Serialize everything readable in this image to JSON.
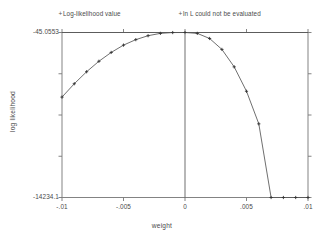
{
  "chart_data": {
    "type": "line",
    "title": "",
    "xlabel": "weight",
    "ylabel": "log likelihood",
    "xlim": [
      -0.01,
      0.01
    ],
    "ylim": [
      -14234.1,
      -45.0553
    ],
    "grid": false,
    "legend_position": "top",
    "xticks": [
      -0.01,
      -0.005,
      0,
      0.005,
      0.01
    ],
    "xticklabels": [
      "-.01",
      "-.005",
      "0",
      ".005",
      ".01"
    ],
    "yticks": [
      -45.0553,
      -14234.1
    ],
    "yticklabels": [
      "-45.0553",
      "-14234.1"
    ],
    "reference_line": {
      "name": "maximum-log-likelihood-line",
      "y": -45.0553,
      "orientation": "horizontal"
    },
    "vertical_line": {
      "name": "mle-weight-line",
      "x": 0,
      "orientation": "vertical"
    },
    "legend": [
      {
        "marker": "+",
        "label": "Log-likelihood value"
      },
      {
        "marker": "+",
        "label": "ln L could not be evaluated"
      }
    ],
    "series": [
      {
        "name": "Log-likelihood value",
        "marker": "+",
        "x": [
          -0.01,
          -0.009,
          -0.008,
          -0.007,
          -0.006,
          -0.005,
          -0.004,
          -0.003,
          -0.002,
          -0.001,
          0.0,
          0.001,
          0.002,
          0.003,
          0.004,
          0.005,
          0.006,
          0.007,
          0.008,
          0.009,
          0.01
        ],
        "y": [
          -5600,
          -4450,
          -3420,
          -2520,
          -1760,
          -1130,
          -660,
          -320,
          -120,
          -50,
          -45.0553,
          -120,
          -560,
          -1500,
          -3000,
          -5100,
          -7900,
          -14234.1,
          -14234.1,
          -14234.1,
          -14234.1
        ]
      }
    ]
  },
  "axis": {
    "x_title": "weight",
    "y_title": "log likelihood"
  }
}
